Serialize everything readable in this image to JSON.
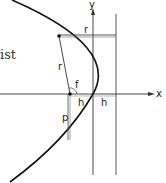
{
  "text_fragment": "ist",
  "axes": {
    "x_label": "x",
    "y_label": "y"
  },
  "labels": {
    "r_top": "r",
    "r_focal": "r",
    "angle": "f",
    "h_left": "h",
    "h_right": "h",
    "p": "p"
  },
  "colors": {
    "stroke": "#222222",
    "background": "#ffffff"
  }
}
